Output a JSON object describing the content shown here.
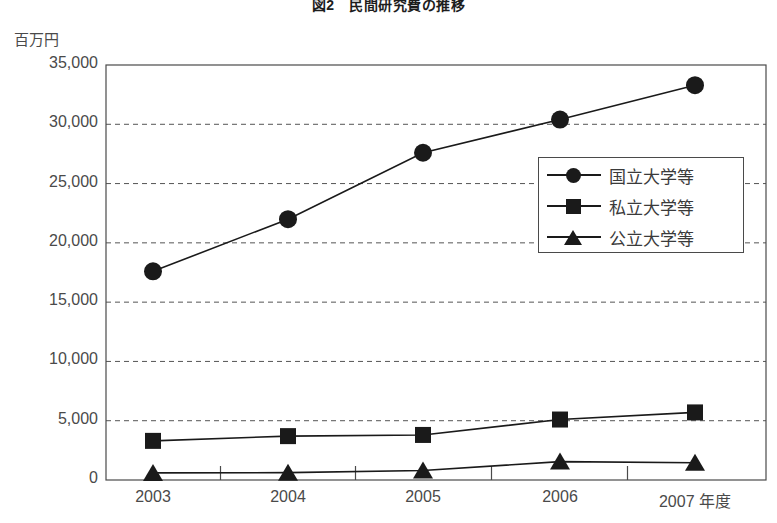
{
  "figure": {
    "title": "図2　民間研究費の推移",
    "unit_label": "百万円"
  },
  "chart_data": {
    "type": "line",
    "title": "図2　民間研究費の推移",
    "xlabel": "年度",
    "ylabel": "百万円",
    "categories": [
      "2003",
      "2004",
      "2005",
      "2006",
      "2007 年度"
    ],
    "x_tick_labels": [
      "2003",
      "2004",
      "2005",
      "2006",
      "2007 年度"
    ],
    "y_tick_labels": [
      "0",
      "5,000",
      "10,000",
      "15,000",
      "20,000",
      "25,000",
      "30,000",
      "35,000"
    ],
    "y_ticks": [
      0,
      5000,
      10000,
      15000,
      20000,
      25000,
      30000,
      35000
    ],
    "ylim": [
      0,
      35000
    ],
    "grid": "horizontal-dashed",
    "legend_position": "center-right-inside",
    "series": [
      {
        "name": "国立大学等",
        "marker": "circle",
        "values": [
          17600,
          22000,
          27600,
          30400,
          33300
        ]
      },
      {
        "name": "私立大学等",
        "marker": "square",
        "values": [
          3300,
          3700,
          3800,
          5100,
          5700
        ]
      },
      {
        "name": "公立大学等",
        "marker": "triangle",
        "values": [
          600,
          620,
          800,
          1550,
          1450
        ]
      }
    ]
  },
  "legend": {
    "items": [
      {
        "label": "国立大学等",
        "marker": "circle"
      },
      {
        "label": "私立大学等",
        "marker": "square"
      },
      {
        "label": "公立大学等",
        "marker": "triangle"
      }
    ]
  }
}
